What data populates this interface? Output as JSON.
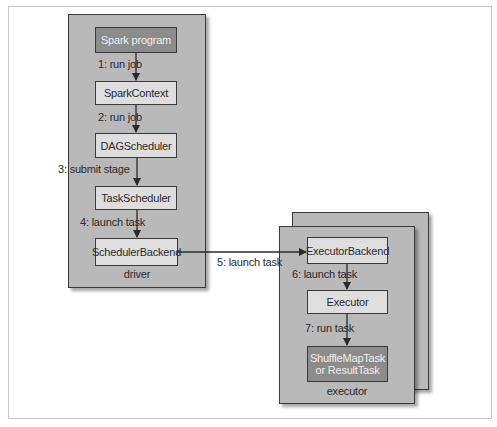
{
  "diagram": {
    "driver": {
      "caption": "driver",
      "nodes": [
        {
          "id": "spark-program",
          "label": "Spark program",
          "style": "dark"
        },
        {
          "id": "spark-context",
          "label": "SparkContext",
          "style": "light"
        },
        {
          "id": "dag-scheduler",
          "label": "DAGScheduler",
          "style": "light"
        },
        {
          "id": "task-scheduler",
          "label": "TaskScheduler",
          "style": "light"
        },
        {
          "id": "scheduler-backend",
          "label": "SchedulerBackend",
          "style": "light"
        }
      ],
      "edges": [
        {
          "from": "spark-program",
          "to": "spark-context",
          "label": "1: run job"
        },
        {
          "from": "spark-context",
          "to": "dag-scheduler",
          "label": "2: run job"
        },
        {
          "from": "dag-scheduler",
          "to": "task-scheduler",
          "label": "3: submit stage"
        },
        {
          "from": "task-scheduler",
          "to": "scheduler-backend",
          "label": "4: launch task"
        }
      ]
    },
    "cross_edge": {
      "from": "scheduler-backend",
      "to": "executor-backend",
      "label": "5: launch task"
    },
    "executor": {
      "caption": "executor",
      "stacked": true,
      "nodes": [
        {
          "id": "executor-backend",
          "label": "ExecutorBackend",
          "style": "light"
        },
        {
          "id": "executor",
          "label": "Executor",
          "style": "light"
        },
        {
          "id": "task",
          "label": "ShuffleMapTask or ResultTask",
          "style": "dark"
        }
      ],
      "edges": [
        {
          "from": "executor-backend",
          "to": "executor",
          "label": "6: launch task"
        },
        {
          "from": "executor",
          "to": "task",
          "label": "7: run task"
        }
      ]
    },
    "colors": {
      "container_fill": "#b9b9b9",
      "node_fill": "#dedede",
      "dark_node_fill": "#8c8c8c",
      "stroke": "#3a3a3a"
    }
  }
}
